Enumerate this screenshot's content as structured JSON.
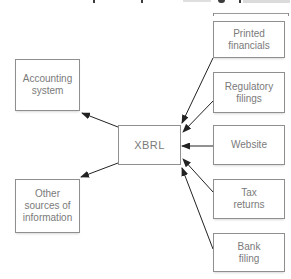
{
  "diagram": {
    "center": {
      "label": "XBRL"
    },
    "outputs": [
      {
        "label": "Accounting\nsystem"
      },
      {
        "label": "Other\nsources of\ninformation"
      }
    ],
    "inputs": [
      {
        "label": "Printed\nfinancials"
      },
      {
        "label": "Regulatory\nfilings"
      },
      {
        "label": "Website"
      },
      {
        "label": "Tax\nreturns"
      },
      {
        "label": "Bank\nfiling"
      }
    ],
    "colors": {
      "background": "#ffffff",
      "box_border": "#8f8f8f",
      "box_text": "#7a7a7a",
      "arrow": "#222222"
    }
  }
}
